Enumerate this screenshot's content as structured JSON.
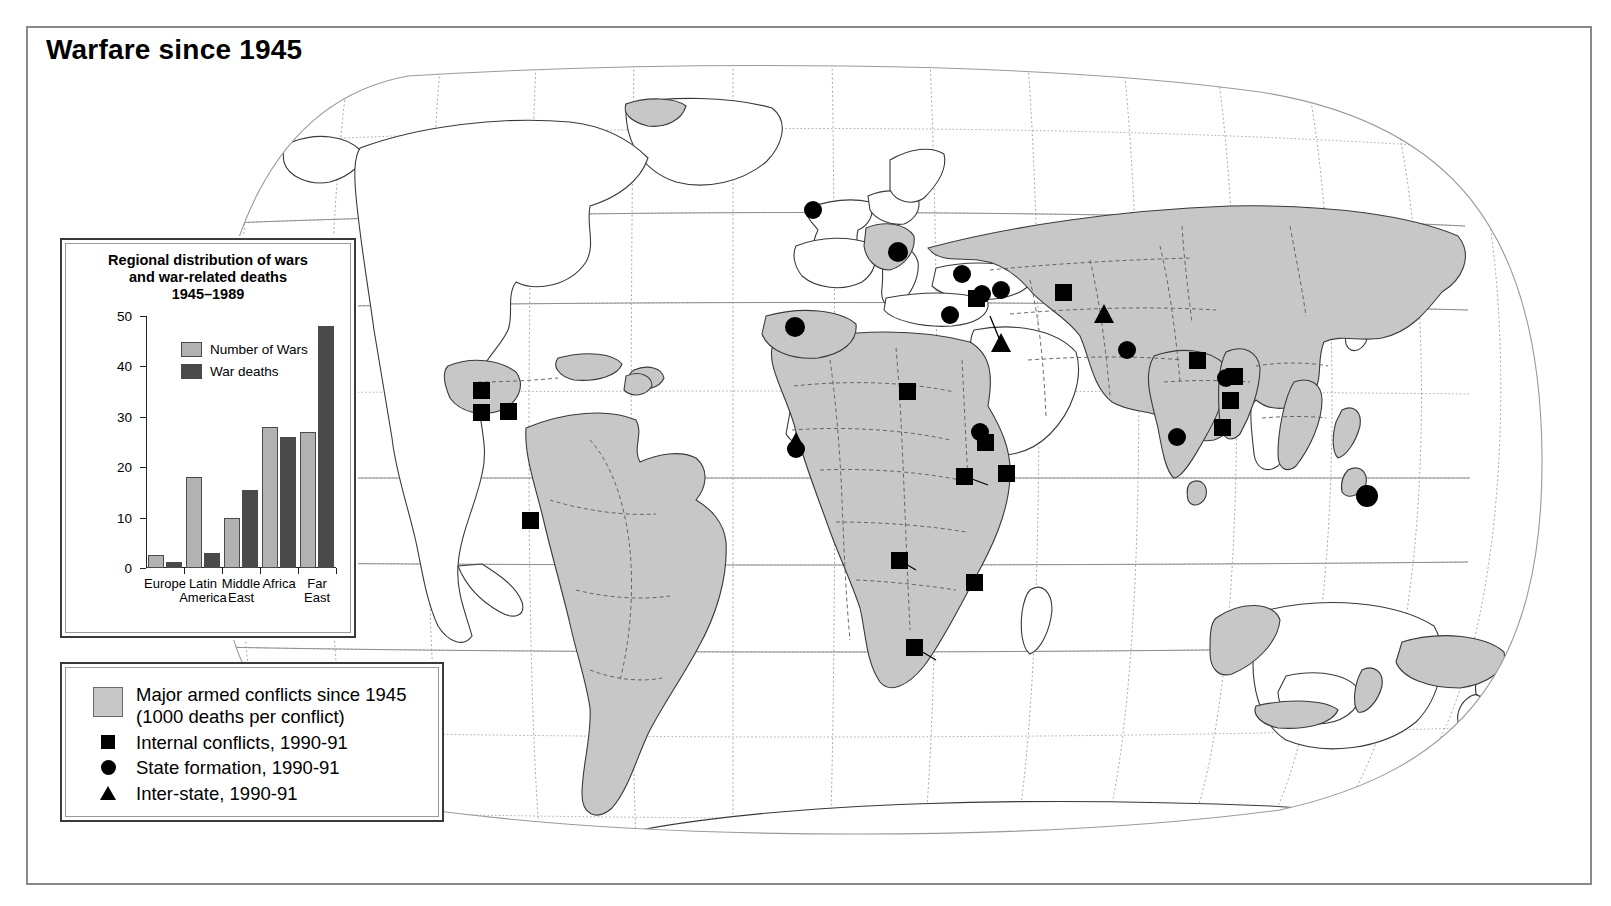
{
  "page": {
    "title": "Warfare since 1945"
  },
  "chart_data": {
    "type": "bar",
    "title": "Regional distribution of wars and war-related deaths 1945–1989",
    "title_lines": [
      "Regional distribution of wars",
      "and war-related deaths",
      "1945–1989"
    ],
    "categories": [
      "Europe",
      "Latin America",
      "Middle East",
      "Africa",
      "Far East"
    ],
    "category_lines": [
      [
        "Europe"
      ],
      [
        "Latin",
        "America"
      ],
      [
        "Middle",
        "East"
      ],
      [
        "Africa"
      ],
      [
        "Far",
        "East"
      ]
    ],
    "series": [
      {
        "name": "Number of Wars",
        "values": [
          2.5,
          18,
          10,
          28,
          27
        ],
        "color": "#b2b2b2"
      },
      {
        "name": "War deaths",
        "values": [
          1.2,
          3,
          15.4,
          26,
          48
        ],
        "color": "#4a4a4a"
      }
    ],
    "xlabel": "",
    "ylabel": "",
    "ylim": [
      0,
      50
    ],
    "yticks": [
      0,
      10,
      20,
      30,
      40,
      50
    ],
    "ytick_labels": [
      "0",
      "10",
      "20",
      "30",
      "40",
      "50"
    ],
    "grid": false,
    "legend_position": "inside-top-left"
  },
  "map_key": {
    "items": [
      {
        "marker": "area-swatch",
        "label_lines": [
          "Major armed conflicts since 1945",
          "(1000 deaths per conflict)"
        ],
        "label": "Major armed conflicts since 1945 (1000 deaths per conflict)"
      },
      {
        "marker": "square",
        "label_lines": [
          "Internal conflicts, 1990-91"
        ],
        "label": "Internal conflicts, 1990-91"
      },
      {
        "marker": "circle",
        "label_lines": [
          "State formation, 1990-91"
        ],
        "label": "State formation, 1990-91"
      },
      {
        "marker": "triangle",
        "label_lines": [
          "Inter-state, 1990-91"
        ],
        "label": "Inter-state, 1990-91"
      }
    ]
  },
  "colors": {
    "conflict_area": "#c7c7c7",
    "marker": "#000000",
    "frame": "#8a8a8a",
    "graticule": "#9a9a9a"
  },
  "map_markers": {
    "internal_conflicts": [
      [
        451,
        360
      ],
      [
        451,
        382
      ],
      [
        478,
        381
      ],
      [
        500,
        490
      ],
      [
        877,
        361
      ],
      [
        934,
        446
      ],
      [
        976,
        443
      ],
      [
        946,
        268
      ],
      [
        1031,
        262
      ],
      [
        1167,
        330
      ],
      [
        1204,
        346
      ],
      [
        1200,
        370
      ],
      [
        1192,
        397
      ],
      [
        869,
        530
      ],
      [
        944,
        552
      ],
      [
        884,
        617
      ],
      [
        1033,
        256
      ],
      [
        955,
        412
      ]
    ],
    "state_formation": [
      [
        783,
        180
      ],
      [
        868,
        222
      ],
      [
        932,
        244
      ],
      [
        950,
        265
      ],
      [
        969,
        260
      ],
      [
        920,
        285
      ],
      [
        765,
        297
      ],
      [
        1097,
        320
      ],
      [
        1147,
        407
      ],
      [
        951,
        402
      ],
      [
        1149,
        350
      ],
      [
        1337,
        466
      ],
      [
        1290,
        382
      ],
      [
        766,
        419
      ]
    ],
    "inter_state": [
      [
        971,
        313
      ],
      [
        1074,
        284
      ],
      [
        766,
        411
      ]
    ]
  }
}
